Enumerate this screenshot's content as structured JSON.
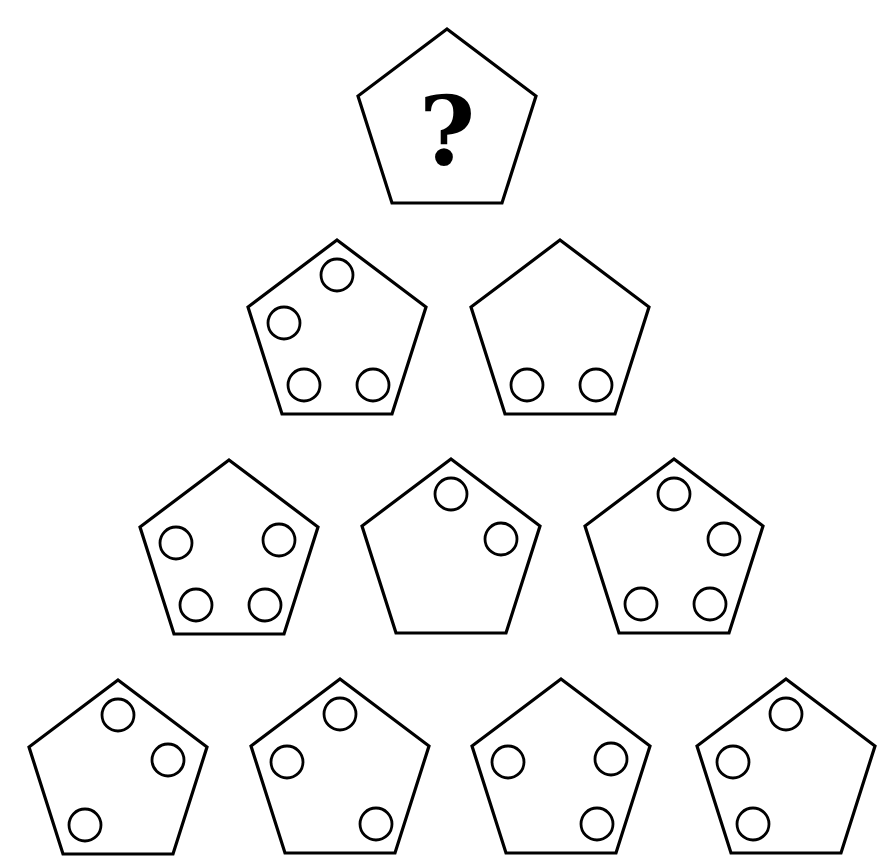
{
  "style": {
    "stroke_color": "#000000",
    "fill_color": "#ffffff",
    "background": "#ffffff"
  },
  "slots_legend": {
    "T": "top vertex",
    "R": "right vertex",
    "BR": "bottom-right vertex",
    "BL": "bottom-left vertex",
    "L": "left vertex"
  },
  "rows": [
    {
      "row": 1,
      "tiles": [
        {
          "id": "r1c1",
          "x": 357,
          "y": 27,
          "content": "?",
          "circles": []
        }
      ]
    },
    {
      "row": 2,
      "tiles": [
        {
          "id": "r2c1",
          "x": 247,
          "y": 238,
          "circles": [
            "T",
            "L",
            "BL",
            "BR"
          ]
        },
        {
          "id": "r2c2",
          "x": 470,
          "y": 238,
          "circles": [
            "BL",
            "BR"
          ]
        }
      ]
    },
    {
      "row": 3,
      "tiles": [
        {
          "id": "r3c1",
          "x": 139,
          "y": 458,
          "circles": [
            "L",
            "R",
            "BL",
            "BR"
          ]
        },
        {
          "id": "r3c2",
          "x": 361,
          "y": 457,
          "circles": [
            "T",
            "R"
          ]
        },
        {
          "id": "r3c3",
          "x": 584,
          "y": 457,
          "circles": [
            "T",
            "R",
            "BL",
            "BR"
          ]
        }
      ]
    },
    {
      "row": 4,
      "tiles": [
        {
          "id": "r4c1",
          "x": 28,
          "y": 678,
          "circles": [
            "T",
            "R",
            "BL"
          ]
        },
        {
          "id": "r4c2",
          "x": 250,
          "y": 677,
          "circles": [
            "T",
            "L",
            "BR"
          ]
        },
        {
          "id": "r4c3",
          "x": 471,
          "y": 677,
          "circles": [
            "L",
            "R",
            "BR"
          ]
        },
        {
          "id": "r4c4",
          "x": 696,
          "y": 677,
          "circles": [
            "T",
            "L",
            "BL"
          ]
        }
      ]
    }
  ]
}
